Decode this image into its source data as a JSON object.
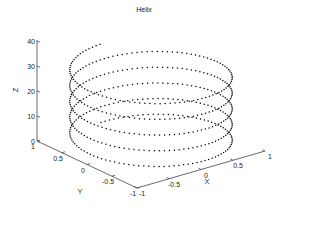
{
  "chart_data": {
    "type": "line",
    "subtype": "3d-dotted-helix",
    "title": "Helix",
    "xlabel": "X",
    "ylabel": "Y",
    "zlabel": "Z",
    "xlim": [
      -1,
      1
    ],
    "ylim": [
      -1,
      1
    ],
    "zlim": [
      0,
      40
    ],
    "xticks": [
      "-1",
      "-0.5",
      "0",
      "0.5",
      "1"
    ],
    "yticks": [
      "-1",
      "-0.5",
      "0",
      "0.5",
      "1"
    ],
    "zticks": [
      "0",
      "10",
      "20",
      "30",
      "40"
    ],
    "grid": false,
    "legend": null,
    "series": [
      {
        "name": "helix",
        "equation": {
          "x": "sin(t)",
          "y": "cos(t)",
          "z": "t"
        },
        "t_range": [
          0,
          31.4159
        ],
        "t_step": 0.0628,
        "turns": 5,
        "marker": "dot",
        "color": "#000000"
      }
    ]
  }
}
